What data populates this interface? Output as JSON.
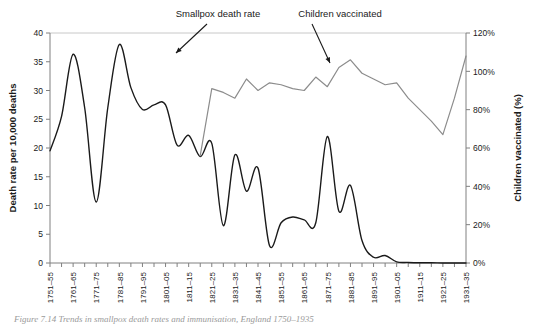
{
  "figure": {
    "caption": "Figure 7.14  Trends in smallpox death rates and immunisation, England 1750–1935"
  },
  "annotations": [
    {
      "name": "smallpox-death-rate",
      "label": "Smallpox death rate",
      "text_x": 218,
      "text_y": 17,
      "arrow_x1": 207,
      "arrow_y1": 24,
      "arrow_x2": 176,
      "arrow_y2": 53
    },
    {
      "name": "children-vaccinated",
      "label": "Children vaccinated",
      "text_x": 340,
      "text_y": 17,
      "arrow_x1": 312,
      "arrow_y1": 24,
      "arrow_x2": 330,
      "arrow_y2": 63
    }
  ],
  "chart_data": {
    "type": "line",
    "title": "",
    "xlabel": "",
    "ylabel": "Death rate per 10,000 deaths",
    "y2label": "Children vaccinated (%)",
    "ylim": [
      0,
      40
    ],
    "y2lim": [
      0,
      120
    ],
    "yticks": [
      "0",
      "5",
      "10",
      "15",
      "20",
      "25",
      "30",
      "35",
      "40"
    ],
    "ytick_values": [
      0,
      5,
      10,
      15,
      20,
      25,
      30,
      35,
      40
    ],
    "y2ticks": [
      "0%",
      "20%",
      "40%",
      "60%",
      "80%",
      "100%",
      "120%"
    ],
    "y2tick_values": [
      0,
      20,
      40,
      60,
      80,
      100,
      120
    ],
    "grid": "top-only",
    "legend": "annotations",
    "categories": [
      "1751–55",
      "1756–60",
      "1761–65",
      "1766–70",
      "1771–75",
      "1776–80",
      "1781–85",
      "1786–90",
      "1791–95",
      "1796–1800",
      "1801–05",
      "1806–10",
      "1811–15",
      "1816–20",
      "1821–25",
      "1826–30",
      "1831–35",
      "1836–40",
      "1841–45",
      "1846–50",
      "1851–55",
      "1856–60",
      "1861–65",
      "1866–70",
      "1871–75",
      "1876–80",
      "1881–85",
      "1886–90",
      "1891–95",
      "1896–1900",
      "1901–05",
      "1906–10",
      "1911–15",
      "1916–20",
      "1921–25",
      "1926–30",
      "1931–35"
    ],
    "xtick_labels": [
      "1751–55",
      "1761–65",
      "1771–75",
      "1781–85",
      "1791–95",
      "1801–05",
      "1811–15",
      "1821–25",
      "1831–35",
      "1841–45",
      "1851–55",
      "1861–65",
      "1871–75",
      "1881–85",
      "1891–95",
      "1901–05",
      "1911–15",
      "1921–25",
      "1931–35"
    ],
    "xtick_indices": [
      0,
      2,
      4,
      6,
      8,
      10,
      12,
      14,
      16,
      18,
      20,
      22,
      24,
      26,
      28,
      30,
      32,
      34,
      36
    ],
    "series": [
      {
        "name": "Smallpox death rate",
        "axis": "left",
        "color": "#1a1a1a",
        "units": "deaths per 10,000 deaths",
        "values": [
          19.5,
          25.5,
          36.3,
          27.0,
          10.6,
          27.0,
          38.0,
          30.5,
          26.7,
          27.5,
          27.5,
          20.5,
          22.2,
          18.5,
          20.8,
          6.5,
          18.8,
          12.5,
          16.5,
          3.0,
          7.0,
          8.0,
          7.5,
          7.0,
          22.0,
          9.0,
          13.5,
          3.9,
          1.0,
          1.3,
          0.2,
          0.1,
          0.05,
          0.05,
          0.0,
          0.0,
          0.0
        ]
      },
      {
        "name": "Children vaccinated",
        "axis": "right",
        "color": "#8c8c8c",
        "units": "%",
        "start_index": 13,
        "values": [
          null,
          null,
          null,
          null,
          null,
          null,
          null,
          null,
          null,
          null,
          null,
          null,
          null,
          56,
          91,
          89,
          86,
          96,
          90,
          94,
          93,
          91,
          90,
          97,
          92,
          102,
          106,
          99,
          96,
          93,
          94,
          86,
          80,
          74,
          67,
          86,
          108
        ]
      }
    ]
  },
  "axes": {
    "left_title": "Death rate per 10,000 deaths",
    "right_title": "Children vaccinated (%)"
  }
}
